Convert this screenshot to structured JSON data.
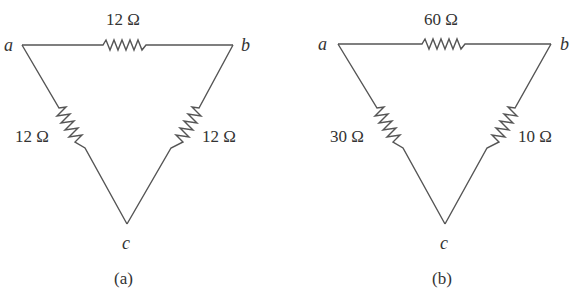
{
  "diagrams": [
    {
      "id": "a",
      "caption": "(a)",
      "nodes": {
        "a": "a",
        "b": "b",
        "c": "c"
      },
      "resistors": {
        "ab": "12 Ω",
        "ac": "12 Ω",
        "bc": "12 Ω"
      }
    },
    {
      "id": "b",
      "caption": "(b)",
      "nodes": {
        "a": "a",
        "b": "b",
        "c": "c"
      },
      "resistors": {
        "ab": "60 Ω",
        "ac": "30 Ω",
        "bc": "10 Ω"
      }
    }
  ],
  "colors": {
    "wire": "#555555",
    "text": "#333333",
    "background": "#ffffff"
  }
}
